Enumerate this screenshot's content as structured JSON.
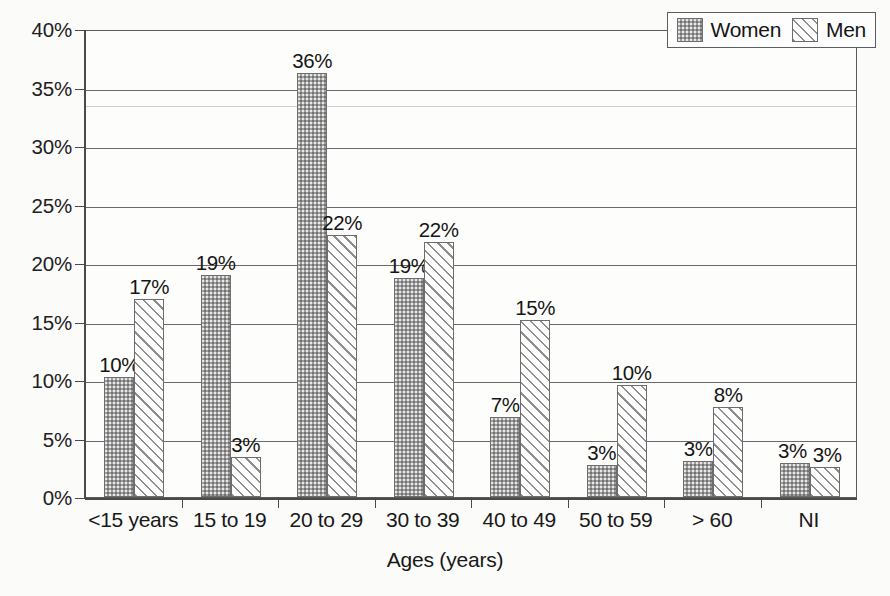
{
  "chart_data": {
    "type": "bar",
    "title": "",
    "xlabel": "Ages (years)",
    "ylabel": "",
    "categories": [
      "<15 years",
      "15 to 19",
      "20 to 29",
      "30 to 39",
      "40 to 49",
      "50 to 59",
      "> 60",
      "NI"
    ],
    "series": [
      {
        "name": "Women",
        "pattern": "stippled-gray",
        "values": [
          10,
          19,
          36,
          19,
          7,
          3,
          3,
          3
        ],
        "labels": [
          "10%",
          "19%",
          "36%",
          "19%",
          "7%",
          "3%",
          "3%",
          "3%"
        ],
        "plotted": [
          10.3,
          19.0,
          36.2,
          18.7,
          6.8,
          2.7,
          3.1,
          2.9
        ]
      },
      {
        "name": "Men",
        "pattern": "diagonal-hatch",
        "values": [
          17,
          3,
          22,
          22,
          15,
          10,
          8,
          3
        ],
        "labels": [
          "17%",
          "3%",
          "22%",
          "22%",
          "15%",
          "10%",
          "8%",
          "3%"
        ],
        "plotted": [
          16.9,
          3.4,
          22.4,
          21.8,
          15.1,
          9.6,
          7.7,
          2.6
        ]
      }
    ],
    "ylim": [
      0,
      40
    ],
    "ytick_values": [
      0,
      5,
      10,
      15,
      20,
      25,
      30,
      35,
      40
    ],
    "ytick_labels": [
      "0%",
      "5%",
      "10%",
      "15%",
      "20%",
      "25%",
      "30%",
      "35%",
      "40%"
    ],
    "grid": true,
    "grid_axis": "y",
    "legend_position": "top-right"
  },
  "legend": {
    "entries": [
      {
        "label": "Women"
      },
      {
        "label": "Men"
      }
    ]
  },
  "colors": {
    "axis": "#4a4a4a",
    "grid": "#6a6a6a",
    "frame": "#5a5a5a",
    "women_fill": "#9e9e9e",
    "men_fill": "#fcfcfc",
    "hatch": "#8e8e8e",
    "background": "#fbfbfa",
    "text": "#181818"
  }
}
